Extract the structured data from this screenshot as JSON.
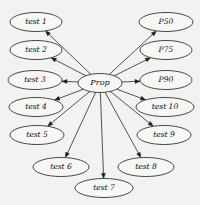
{
  "figure": {
    "type": "radial-node-link-diagram",
    "background_color": "#f2f2f0",
    "node_fill_color": "#f7f7f5",
    "node_stroke_color": "#1c1c1c",
    "edge_color": "#2a2a2a",
    "label_color": "#111111",
    "width": 200,
    "height": 205
  },
  "center_node": {
    "id": "prop",
    "label": "Prop",
    "cx": 100,
    "cy": 83,
    "rx": 22,
    "ry": 9.5
  },
  "leaf_nodes": [
    {
      "id": "test-1",
      "label": "test 1",
      "cx": 36,
      "cy": 22,
      "rx": 26,
      "ry": 9.5
    },
    {
      "id": "test-2",
      "label": "test 2",
      "cx": 36,
      "cy": 50,
      "rx": 26,
      "ry": 9.5
    },
    {
      "id": "test-3",
      "label": "test 3",
      "cx": 35,
      "cy": 80,
      "rx": 27,
      "ry": 9.5
    },
    {
      "id": "test-4",
      "label": "test 4",
      "cx": 36,
      "cy": 107,
      "rx": 27,
      "ry": 9.5
    },
    {
      "id": "test-5",
      "label": "test 5",
      "cx": 37,
      "cy": 135,
      "rx": 27,
      "ry": 9.5
    },
    {
      "id": "test-6",
      "label": "test 6",
      "cx": 61,
      "cy": 167,
      "rx": 28,
      "ry": 9.5
    },
    {
      "id": "test-7",
      "label": "test 7",
      "cx": 104,
      "cy": 188,
      "rx": 29,
      "ry": 9.5
    },
    {
      "id": "test-8",
      "label": "test 8",
      "cx": 146,
      "cy": 167,
      "rx": 28,
      "ry": 9.5
    },
    {
      "id": "test-9",
      "label": "test 9",
      "cx": 164,
      "cy": 135,
      "rx": 27,
      "ry": 9.5
    },
    {
      "id": "test-10",
      "label": "test 10",
      "cx": 165,
      "cy": 107,
      "rx": 29,
      "ry": 9.5
    },
    {
      "id": "p90",
      "label": "P90",
      "cx": 166,
      "cy": 80,
      "rx": 26,
      "ry": 9.5
    },
    {
      "id": "p75",
      "label": "P75",
      "cx": 166,
      "cy": 50,
      "rx": 26,
      "ry": 9.5
    },
    {
      "id": "p50",
      "label": "P50",
      "cx": 166,
      "cy": 22,
      "rx": 27,
      "ry": 9.5
    }
  ],
  "edges": [
    {
      "id": "edge-prop-test-1",
      "from": "prop",
      "to": "test-1",
      "directed": true
    },
    {
      "id": "edge-prop-test-2",
      "from": "prop",
      "to": "test-2",
      "directed": true
    },
    {
      "id": "edge-prop-test-3",
      "from": "prop",
      "to": "test-3",
      "directed": true
    },
    {
      "id": "edge-prop-test-4",
      "from": "prop",
      "to": "test-4",
      "directed": true
    },
    {
      "id": "edge-prop-test-5",
      "from": "prop",
      "to": "test-5",
      "directed": true
    },
    {
      "id": "edge-prop-test-6",
      "from": "prop",
      "to": "test-6",
      "directed": true
    },
    {
      "id": "edge-prop-test-7",
      "from": "prop",
      "to": "test-7",
      "directed": true
    },
    {
      "id": "edge-prop-test-8",
      "from": "prop",
      "to": "test-8",
      "directed": true
    },
    {
      "id": "edge-prop-test-9",
      "from": "prop",
      "to": "test-9",
      "directed": true
    },
    {
      "id": "edge-prop-test-10",
      "from": "prop",
      "to": "test-10",
      "directed": true
    },
    {
      "id": "edge-prop-p90",
      "from": "prop",
      "to": "p90",
      "directed": true
    },
    {
      "id": "edge-prop-p75",
      "from": "prop",
      "to": "p75",
      "directed": true
    },
    {
      "id": "edge-prop-p50",
      "from": "prop",
      "to": "p50",
      "directed": true
    }
  ]
}
